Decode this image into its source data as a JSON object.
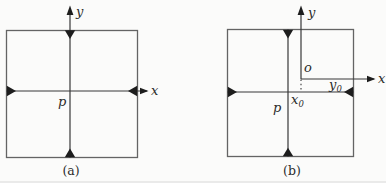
{
  "figure_a": {
    "caption": "(a)",
    "labels": {
      "y_axis": "y",
      "x_axis": "x",
      "center_point": "p"
    }
  },
  "figure_b": {
    "caption": "(b)",
    "labels": {
      "y_axis": "y",
      "x_axis": "x",
      "center_point": "p",
      "origin": "o",
      "x_offset_base": "x",
      "x_offset_sub": "0",
      "y_offset_base": "y",
      "y_offset_sub": "0"
    }
  },
  "colors": {
    "background": "#fbfbfa",
    "square_border": "#646464",
    "diagram_line": "#383838",
    "arrowhead": "#1d1d1d",
    "label_text": "#2b2b2b",
    "divider": "#d9d9d9"
  }
}
